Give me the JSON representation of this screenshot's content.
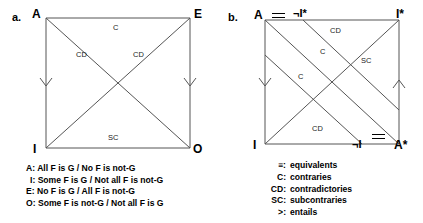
{
  "figure": {
    "panels": [
      {
        "tag": "a.",
        "corners": [
          {
            "name": "corner-A",
            "label": "A"
          },
          {
            "name": "corner-E",
            "label": "E"
          },
          {
            "name": "corner-I",
            "label": "I"
          },
          {
            "name": "corner-O",
            "label": "O"
          }
        ],
        "edge_labels": [
          {
            "name": "relation-top",
            "label": "C"
          },
          {
            "name": "relation-bottom",
            "label": "SC"
          },
          {
            "name": "relation-diagonal-left",
            "label": "CD"
          },
          {
            "name": "relation-diagonal-right",
            "label": "CD"
          }
        ],
        "legend_lines": [
          "A: All F is G / No F is not-G",
          "I: Some F is G / Not all F is not-G",
          "E: No F is G / All F is not-G",
          "O: Some F is not-G / Not all F is G"
        ]
      },
      {
        "tag": "b.",
        "corners": [
          {
            "name": "corner-A",
            "label": "A"
          },
          {
            "name": "corner-not-I-star",
            "label": "¬I*"
          },
          {
            "name": "corner-I-star",
            "label": "I*"
          },
          {
            "name": "corner-I",
            "label": "I"
          },
          {
            "name": "corner-not-I",
            "label": "¬I"
          },
          {
            "name": "corner-A-star",
            "label": "A*"
          }
        ],
        "edge_labels": [
          {
            "name": "relation-top-cd",
            "label": "CD"
          },
          {
            "name": "relation-upper-c",
            "label": "C"
          },
          {
            "name": "relation-left-c",
            "label": "C"
          },
          {
            "name": "relation-right-sc",
            "label": "SC"
          },
          {
            "name": "relation-bottom-cd",
            "label": "CD"
          }
        ]
      }
    ],
    "legend": {
      "entries": [
        {
          "key": "≡:",
          "value": "equivalents"
        },
        {
          "key": "C:",
          "value": "contraries"
        },
        {
          "key": "CD:",
          "value": "contradictories"
        },
        {
          "key": "SC:",
          "value": "subcontraries"
        },
        {
          "key": ">:",
          "value": "entails"
        }
      ]
    },
    "colors": {
      "stroke": "#555555",
      "text": "#000000",
      "background": "#ffffff"
    }
  }
}
